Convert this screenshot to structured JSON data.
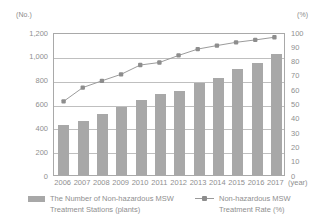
{
  "axes": {
    "left_unit": "(No.)",
    "right_unit": "(%)",
    "x_unit": "(year)"
  },
  "legend": {
    "bar_line1": "The Number of Non-hazardous MSW",
    "bar_line2": "Treatment Stations (plants)",
    "line_line1": "Non-hazardous MSW",
    "line_line2": "Treatment Rate (%)"
  },
  "colors": {
    "bar": "#a8a8a8",
    "line": "#9a9a9a",
    "marker": "#8d8d8d",
    "grid": "#bfbfbf",
    "axis": "#a9a9a9",
    "text": "#8f8f8f"
  },
  "chart_data": {
    "type": "bar",
    "title": "",
    "xlabel": "(year)",
    "ylabel": "(No.)",
    "y2label": "(%)",
    "grid": true,
    "legend_position": "bottom",
    "categories": [
      "2006",
      "2007",
      "2008",
      "2009",
      "2010",
      "2011",
      "2012",
      "2013",
      "2014",
      "2015",
      "2016",
      "2017"
    ],
    "ylim": [
      0,
      1200
    ],
    "yticks": [
      "1,200",
      "1,000",
      "800",
      "600",
      "400",
      "200",
      "0"
    ],
    "ytick_values": [
      1200,
      1000,
      800,
      600,
      400,
      200,
      0
    ],
    "y2lim": [
      0,
      100
    ],
    "y2ticks": [
      "100",
      "90",
      "80",
      "70",
      "60",
      "50",
      "40",
      "30",
      "20",
      "10",
      "0"
    ],
    "y2tick_values": [
      100,
      90,
      80,
      70,
      60,
      50,
      40,
      30,
      20,
      10,
      0
    ],
    "series": [
      {
        "name": "The Number of Non-hazardous MSW Treatment Stations (plants)",
        "type": "bar",
        "axis": "left",
        "values": [
          419,
          457,
          512,
          567,
          628,
          677,
          701,
          769,
          818,
          890,
          940,
          1013
        ]
      },
      {
        "name": "Non-hazardous MSW Treatment Rate (%)",
        "type": "line",
        "axis": "right",
        "values": [
          52.2,
          62.0,
          66.8,
          71.4,
          78.0,
          79.8,
          84.8,
          89.3,
          91.8,
          94.1,
          95.8,
          97.7
        ]
      }
    ]
  }
}
